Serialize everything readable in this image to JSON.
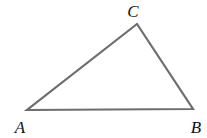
{
  "diagram": {
    "type": "triangle",
    "stroke_color": "#6e6e6e",
    "vertices": [
      {
        "label": "A",
        "x": 27,
        "y": 110,
        "label_x": 20,
        "label_y": 133
      },
      {
        "label": "B",
        "x": 193,
        "y": 109,
        "label_x": 196,
        "label_y": 133
      },
      {
        "label": "C",
        "x": 137,
        "y": 24,
        "label_x": 133,
        "label_y": 17
      }
    ]
  }
}
